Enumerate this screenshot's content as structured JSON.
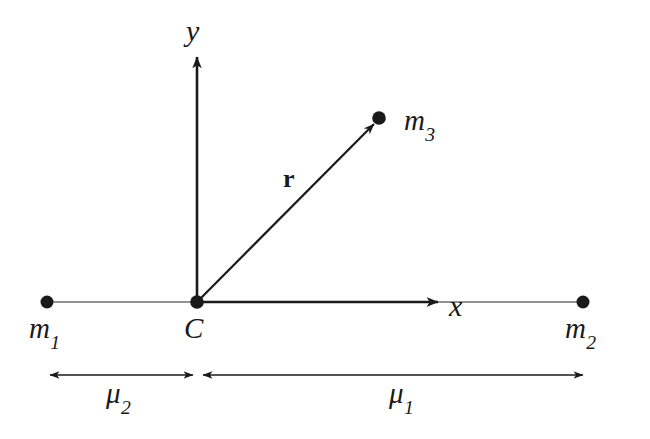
{
  "figure": {
    "background_color": "#ffffff",
    "ink_color": "#1a1a1a",
    "width": 650,
    "height": 439
  },
  "axes": {
    "y_label": "y",
    "x_label": "x",
    "origin_label": "C"
  },
  "masses": [
    {
      "key": "m1",
      "base": "m",
      "sub": "1"
    },
    {
      "key": "m2",
      "base": "m",
      "sub": "2"
    },
    {
      "key": "m3",
      "base": "m",
      "sub": "3"
    }
  ],
  "vector": {
    "label": "r",
    "description": "position vector from C to m3"
  },
  "distances": [
    {
      "key": "mu2",
      "base": "μ",
      "sub": "2",
      "side": "left"
    },
    {
      "key": "mu1",
      "base": "μ",
      "sub": "1",
      "side": "right"
    }
  ],
  "geometry": {
    "m1_point": [
      47,
      302
    ],
    "C_point": [
      197,
      302
    ],
    "m2_point": [
      583,
      302
    ],
    "m3_point": [
      379,
      118
    ],
    "x_axis_arrow_tip": [
      438,
      302
    ],
    "y_axis_arrow_tip": [
      197,
      57
    ],
    "mu2_span": [
      50,
      193
    ],
    "mu1_span": [
      203,
      583
    ],
    "dimension_line_y": 375
  }
}
